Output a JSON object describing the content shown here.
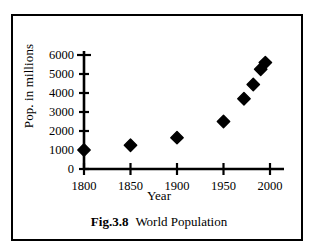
{
  "figure": {
    "caption_label": "Fig.3.8",
    "caption_text": "World Population"
  },
  "chart_data": {
    "type": "scatter",
    "title": "",
    "xlabel": "Year",
    "ylabel": "Pop. in millions",
    "xlim": [
      1800,
      2000
    ],
    "ylim": [
      0,
      6000
    ],
    "grid": false,
    "legend": null,
    "x_ticks": [
      1800,
      1850,
      1900,
      1950,
      2000
    ],
    "x_tick_labels": [
      "1800",
      "1850",
      "1900",
      "1950",
      "2000"
    ],
    "y_ticks": [
      0,
      1000,
      2000,
      3000,
      4000,
      5000,
      6000
    ],
    "y_tick_labels": [
      "0",
      "1000",
      "2000",
      "3000",
      "4000",
      "5000",
      "6000"
    ],
    "marker": "diamond",
    "marker_color": "#000000",
    "points": [
      {
        "x": 1800,
        "y": 1000
      },
      {
        "x": 1850,
        "y": 1250
      },
      {
        "x": 1900,
        "y": 1650
      },
      {
        "x": 1950,
        "y": 2500
      },
      {
        "x": 1972,
        "y": 3700
      },
      {
        "x": 1982,
        "y": 4450
      },
      {
        "x": 1990,
        "y": 5250
      },
      {
        "x": 1995,
        "y": 5600
      }
    ]
  }
}
